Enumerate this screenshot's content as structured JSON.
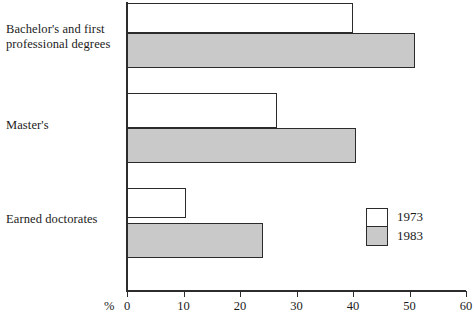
{
  "chart_data": {
    "type": "bar",
    "orientation": "horizontal",
    "title": "",
    "xlabel": "%",
    "ylabel": "",
    "xlim": [
      0,
      60
    ],
    "xticks": [
      0,
      10,
      20,
      30,
      40,
      50,
      60
    ],
    "xtick_labels": [
      "0",
      "10",
      "20",
      "30",
      "40",
      "50",
      "60"
    ],
    "grid": false,
    "legend_position": "right-bottom",
    "categories": [
      "Bachelor's and first professional degrees",
      "Master's",
      "Earned doctorates"
    ],
    "series": [
      {
        "name": "1973",
        "color": "#ffffff",
        "values": [
          40,
          26.5,
          10.5
        ]
      },
      {
        "name": "1983",
        "color": "#c9c9c9",
        "values": [
          51,
          40.5,
          24
        ]
      }
    ]
  },
  "labels": {
    "category_0_line_1": "Bachelor's and first",
    "category_0_line_2": "professional degrees",
    "category_1": "Master's",
    "category_2": "Earned doctorates",
    "percent_symbol": "%"
  },
  "axis": {
    "tick_0": "0",
    "tick_1": "10",
    "tick_2": "20",
    "tick_3": "30",
    "tick_4": "40",
    "tick_5": "50",
    "tick_6": "60"
  },
  "legend": {
    "entry_0": "1973",
    "entry_1": "1983"
  }
}
